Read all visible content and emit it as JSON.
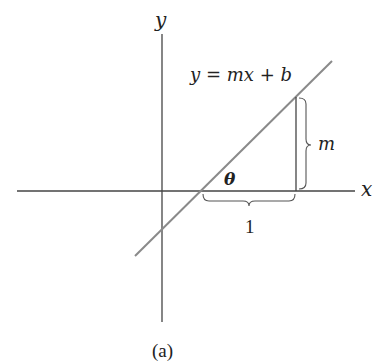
{
  "figure": {
    "caption": "(a)",
    "axes": {
      "x_label": "x",
      "y_label": "y"
    },
    "line_equation": "y = mx + b",
    "angle_label": "θ",
    "rise_label": "m",
    "run_label": "1",
    "colors": {
      "axes": "#333333",
      "line": "#888888",
      "text": "#222222"
    }
  }
}
